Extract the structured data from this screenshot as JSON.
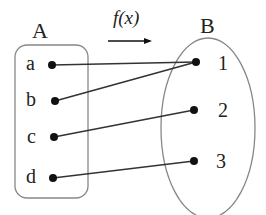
{
  "diagram": {
    "function_label": "f(x)",
    "set_a": {
      "label": "A",
      "elements": [
        "a",
        "b",
        "c",
        "d"
      ]
    },
    "set_b": {
      "label": "B",
      "elements": [
        "1",
        "2",
        "3"
      ]
    },
    "mappings": [
      {
        "from": "a",
        "to": "1"
      },
      {
        "from": "b",
        "to": "1"
      },
      {
        "from": "c",
        "to": "2"
      },
      {
        "from": "d",
        "to": "3"
      }
    ],
    "colors": {
      "line": "#333333",
      "border": "#888888",
      "dot": "#111111",
      "text": "#222222"
    }
  }
}
